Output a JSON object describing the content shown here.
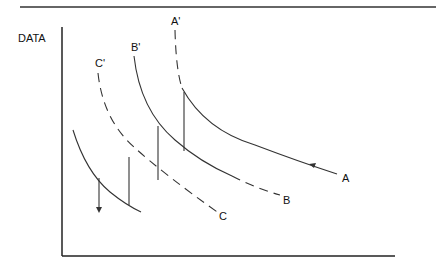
{
  "diagram": {
    "y_axis_label": "DATA",
    "curve_labels": {
      "A_top": "A'",
      "B_top": "B'",
      "C_top": "C'",
      "A_end": "A",
      "B_end": "B",
      "C_end": "C"
    },
    "colors": {
      "line": "#333333",
      "text": "#111111",
      "background": "#ffffff"
    }
  }
}
